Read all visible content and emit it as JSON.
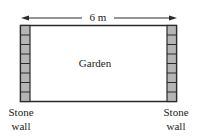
{
  "diagram": {
    "dimension_label": "6 m",
    "garden_label": "Garden",
    "left_wall_label": [
      "Stone",
      "wall"
    ],
    "right_wall_label": [
      "Stone",
      "wall"
    ],
    "wall_block_count": 8,
    "colors": {
      "outline": "#2a2a2a",
      "wall_fill": "#b5b5b5",
      "background": "#ffffff"
    }
  }
}
